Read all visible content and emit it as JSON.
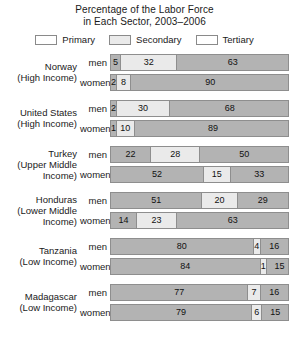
{
  "title": {
    "line1": "Percentage of the Labor Force",
    "line2": "in Each Sector, 2003–2006"
  },
  "legend": {
    "position": "top-center",
    "items": [
      {
        "label": "Primary",
        "color": "#b3b3b3"
      },
      {
        "label": "Secondary",
        "color": "#eaeaea"
      },
      {
        "label": "Tertiary",
        "color": "#b3b3b3"
      }
    ]
  },
  "row_labels": {
    "men": "men",
    "women": "women"
  },
  "groups": [
    {
      "country": "Norway",
      "income_lines": [
        "(High Income)"
      ],
      "label_lines": [
        "Norway",
        "(High Income)"
      ],
      "men": {
        "primary": 5,
        "secondary": 32,
        "tertiary": 63
      },
      "women": {
        "primary": 2,
        "secondary": 8,
        "tertiary": 90
      }
    },
    {
      "country": "United States",
      "income_lines": [
        "(High Income)"
      ],
      "label_lines": [
        "United States",
        "(High Income)"
      ],
      "men": {
        "primary": 2,
        "secondary": 30,
        "tertiary": 68
      },
      "women": {
        "primary": 1,
        "secondary": 10,
        "tertiary": 89
      }
    },
    {
      "country": "Turkey",
      "income_lines": [
        "(Upper Middle",
        "Income)"
      ],
      "label_lines": [
        "Turkey",
        "(Upper Middle",
        "Income)"
      ],
      "men": {
        "primary": 22,
        "secondary": 28,
        "tertiary": 50
      },
      "women": {
        "primary": 52,
        "secondary": 15,
        "tertiary": 33
      }
    },
    {
      "country": "Honduras",
      "income_lines": [
        "(Lower Middle",
        "Income)"
      ],
      "label_lines": [
        "Honduras",
        "(Lower Middle",
        "Income)"
      ],
      "men": {
        "primary": 51,
        "secondary": 20,
        "tertiary": 29
      },
      "women": {
        "primary": 14,
        "secondary": 23,
        "tertiary": 63
      }
    },
    {
      "country": "Tanzania",
      "income_lines": [
        "(Low Income)"
      ],
      "label_lines": [
        "Tanzania",
        "(Low Income)"
      ],
      "men": {
        "primary": 80,
        "secondary": 4,
        "tertiary": 16
      },
      "women": {
        "primary": 84,
        "secondary": 1,
        "tertiary": 15
      }
    },
    {
      "country": "Madagascar",
      "income_lines": [
        "(Low Income)"
      ],
      "label_lines": [
        "Madagascar",
        "(Low Income)"
      ],
      "men": {
        "primary": 77,
        "secondary": 7,
        "tertiary": 16
      },
      "women": {
        "primary": 79,
        "secondary": 6,
        "tertiary": 15
      }
    }
  ],
  "chart_data": {
    "type": "bar",
    "orientation": "horizontal",
    "stacked": true,
    "normalized": true,
    "title": "Percentage of the Labor Force in Each Sector, 2003–2006",
    "xlabel": "",
    "ylabel": "",
    "xlim": [
      0,
      100
    ],
    "grid": false,
    "legend_position": "top-center",
    "legend": [
      "Primary",
      "Secondary",
      "Tertiary"
    ],
    "categories": [
      "Norway (High Income) – men",
      "Norway (High Income) – women",
      "United States (High Income) – men",
      "United States (High Income) – women",
      "Turkey (Upper Middle Income) – men",
      "Turkey (Upper Middle Income) – women",
      "Honduras (Lower Middle Income) – men",
      "Honduras (Lower Middle Income) – women",
      "Tanzania (Low Income) – men",
      "Tanzania (Low Income) – women",
      "Madagascar (Low Income) – men",
      "Madagascar (Low Income) – women"
    ],
    "series": [
      {
        "name": "Primary",
        "values": [
          5,
          2,
          2,
          1,
          22,
          52,
          51,
          14,
          80,
          84,
          77,
          79
        ]
      },
      {
        "name": "Secondary",
        "values": [
          32,
          8,
          30,
          10,
          28,
          15,
          20,
          23,
          4,
          1,
          7,
          6
        ]
      },
      {
        "name": "Tertiary",
        "values": [
          63,
          90,
          68,
          89,
          50,
          33,
          29,
          63,
          16,
          15,
          16,
          15
        ]
      }
    ]
  }
}
